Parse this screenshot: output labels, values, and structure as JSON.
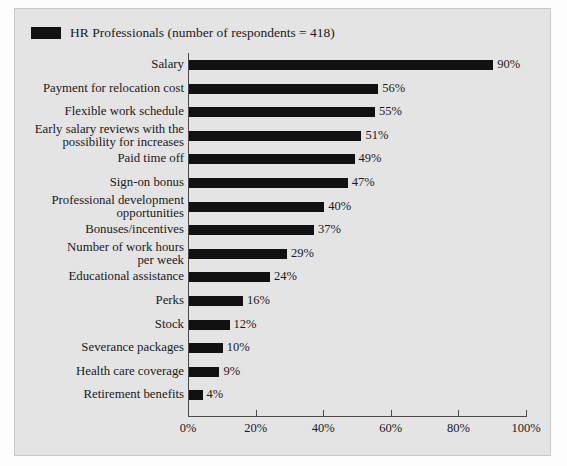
{
  "legend": {
    "swatch_color": "#111111",
    "label": "HR Professionals (number of respondents = 418)"
  },
  "colors": {
    "bar": "#111111",
    "panel_background": "#e4e4e4",
    "axis": "#4a4a4a",
    "text": "#1a1a1a"
  },
  "chart_data": {
    "type": "bar",
    "orientation": "horizontal",
    "title": "",
    "subtitle": "",
    "xlabel": "",
    "ylabel": "",
    "xlim": [
      0,
      100
    ],
    "grid": false,
    "legend_position": "top-left",
    "xticks": [
      0,
      20,
      40,
      60,
      80,
      100
    ],
    "xtick_labels": [
      "0%",
      "20%",
      "40%",
      "60%",
      "80%",
      "100%"
    ],
    "categories": [
      "Salary",
      "Payment for relocation cost",
      "Flexible work schedule",
      "Early salary reviews with the possibility for increases",
      "Paid time off",
      "Sign-on bonus",
      "Professional development opportunities",
      "Bonuses/incentives",
      "Number of work hours per week",
      "Educational assistance",
      "Perks",
      "Stock",
      "Severance packages",
      "Health care coverage",
      "Retirement benefits"
    ],
    "category_lines": [
      [
        "Salary"
      ],
      [
        "Payment for relocation cost"
      ],
      [
        "Flexible work schedule"
      ],
      [
        "Early salary reviews with the",
        "possibility for increases"
      ],
      [
        "Paid time off"
      ],
      [
        "Sign-on bonus"
      ],
      [
        "Professional development",
        "opportunities"
      ],
      [
        "Bonuses/incentives"
      ],
      [
        "Number of work hours",
        "per week"
      ],
      [
        "Educational assistance"
      ],
      [
        "Perks"
      ],
      [
        "Stock"
      ],
      [
        "Severance packages"
      ],
      [
        "Health care coverage"
      ],
      [
        "Retirement benefits"
      ]
    ],
    "values": [
      90,
      56,
      55,
      51,
      49,
      47,
      40,
      37,
      29,
      24,
      16,
      12,
      10,
      9,
      4
    ],
    "value_labels": [
      "90%",
      "56%",
      "55%",
      "51%",
      "49%",
      "47%",
      "40%",
      "37%",
      "29%",
      "24%",
      "16%",
      "12%",
      "10%",
      "9%",
      "4%"
    ],
    "series": [
      {
        "name": "HR Professionals (number of respondents = 418)",
        "values": [
          90,
          56,
          55,
          51,
          49,
          47,
          40,
          37,
          29,
          24,
          16,
          12,
          10,
          9,
          4
        ]
      }
    ]
  }
}
